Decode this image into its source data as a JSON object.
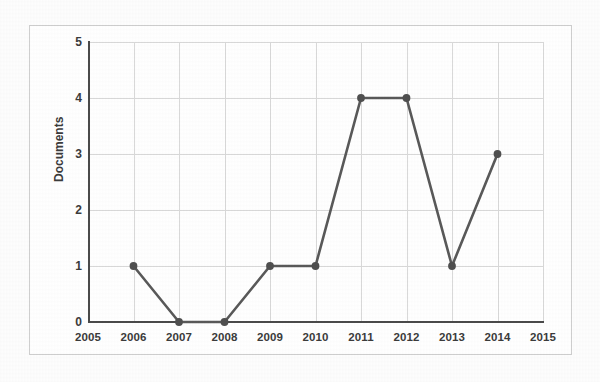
{
  "chart_data": {
    "type": "line",
    "title": "",
    "subtitle": "",
    "xlabel": "",
    "ylabel": "Documents",
    "x": [
      2005,
      2006,
      2007,
      2008,
      2009,
      2010,
      2011,
      2012,
      2013,
      2014,
      2015
    ],
    "xtick_labels": [
      "2005",
      "2006",
      "2007",
      "2008",
      "2009",
      "2010",
      "2011",
      "2012",
      "2013",
      "2014",
      "2015"
    ],
    "ytick_labels": [
      "0",
      "1",
      "2",
      "3",
      "4",
      "5"
    ],
    "ylim": [
      0,
      5
    ],
    "xlim": [
      2005,
      2015
    ],
    "grid": true,
    "legend": false,
    "legend_position": "none",
    "series": [
      {
        "name": "Documents",
        "marker": "circle",
        "color": "#595959",
        "points": [
          {
            "x": 2006,
            "y": 1
          },
          {
            "x": 2007,
            "y": 0
          },
          {
            "x": 2008,
            "y": 0
          },
          {
            "x": 2009,
            "y": 1
          },
          {
            "x": 2010,
            "y": 1
          },
          {
            "x": 2011,
            "y": 4
          },
          {
            "x": 2012,
            "y": 4
          },
          {
            "x": 2013,
            "y": 1
          },
          {
            "x": 2014,
            "y": 3
          }
        ]
      }
    ],
    "colors": {
      "line": "#595959",
      "marker": "#4f4f4f",
      "gridline": "#d9d9d9",
      "axis": "#4a4a4a",
      "frame": "#cfcfcf",
      "text": "#3b3b3b",
      "background": "#ffffff"
    }
  }
}
